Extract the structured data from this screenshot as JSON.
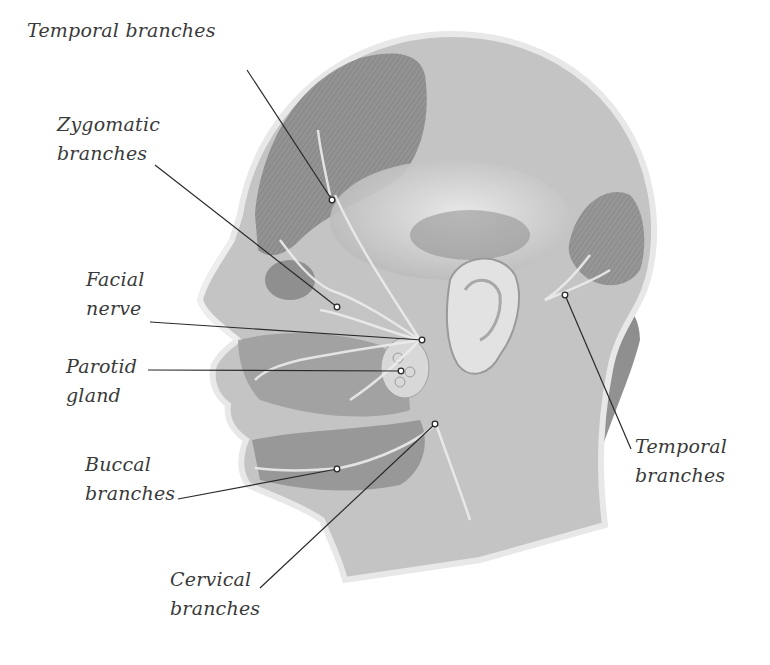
{
  "diagram": {
    "colors": {
      "background": "#ffffff",
      "label_text": "#3a3a3a",
      "leader_line": "#2a2a2a",
      "skin_outline": "#e6e6e6",
      "muscle_dark": "#7a7a7a",
      "muscle_mid": "#a8a8a8",
      "tissue_light": "#d4d4d4"
    },
    "labels": [
      {
        "id": "temporal-branches-upper",
        "lines": [
          "Temporal branches"
        ],
        "x": 27,
        "y": 16,
        "anchor": [
          332,
          200
        ],
        "line_start": [
          247,
          70
        ]
      },
      {
        "id": "zygomatic-branches",
        "lines": [
          "Zygomatic",
          "branches"
        ],
        "x": 57,
        "y": 110,
        "anchor": [
          337,
          307
        ],
        "line_start": [
          155,
          165
        ]
      },
      {
        "id": "facial-nerve",
        "lines": [
          "Facial",
          "nerve"
        ],
        "x": 86,
        "y": 265,
        "anchor": [
          422,
          340
        ],
        "line_start": [
          150,
          322
        ]
      },
      {
        "id": "parotid-gland",
        "lines": [
          "Parotid",
          "gland"
        ],
        "x": 66,
        "y": 352,
        "anchor": [
          401,
          371
        ],
        "line_start": [
          148,
          370
        ]
      },
      {
        "id": "buccal-branches",
        "lines": [
          "Buccal",
          "branches"
        ],
        "x": 85,
        "y": 450,
        "anchor": [
          337,
          469
        ],
        "line_start": [
          178,
          499
        ]
      },
      {
        "id": "cervical-branches",
        "lines": [
          "Cervical",
          "branches"
        ],
        "x": 170,
        "y": 565,
        "anchor": [
          435,
          424
        ],
        "line_start": [
          260,
          588
        ]
      },
      {
        "id": "temporal-branches-lower",
        "lines": [
          "Temporal",
          "branches"
        ],
        "x": 635,
        "y": 432,
        "anchor": [
          565,
          295
        ],
        "line_start": [
          631,
          449
        ]
      }
    ]
  }
}
